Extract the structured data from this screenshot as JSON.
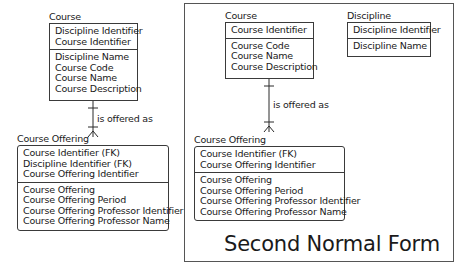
{
  "left": {
    "course": {
      "title": "Course",
      "key_attributes": [
        "Discipline Identifier",
        "Course Identifier"
      ],
      "attributes": [
        "Discipline Name",
        "Course Code",
        "Course Name",
        "Course Description"
      ]
    },
    "relationship": {
      "label": "is offered as"
    },
    "course_offering": {
      "title": "Course Offering",
      "key_attributes": [
        "Course Identifier (FK)",
        "Discipline Identifier (FK)",
        "Course Offering Identifier"
      ],
      "attributes": [
        "Course Offering",
        "Course Offering Period",
        "Course Offering Professor Identifier",
        "Course Offering Professor Name"
      ]
    }
  },
  "right": {
    "course": {
      "title": "Course",
      "key_attributes": [
        "Course Identifier"
      ],
      "attributes": [
        "Course Code",
        "Course Name",
        "Course Description"
      ]
    },
    "discipline": {
      "title": "Discipline",
      "key_attributes": [
        "Discipline Identifier"
      ],
      "attributes": [
        "Discipline Name"
      ]
    },
    "relationship": {
      "label": "is offered as"
    },
    "course_offering": {
      "title": "Course Offering",
      "key_attributes": [
        "Course Identifier (FK)",
        "Course Offering Identifier"
      ],
      "attributes": [
        "Course Offering",
        "Course Offering Period",
        "Course Offering Professor Identifier",
        "Course Offering Professor Name"
      ]
    },
    "caption": "Second Normal Form"
  }
}
